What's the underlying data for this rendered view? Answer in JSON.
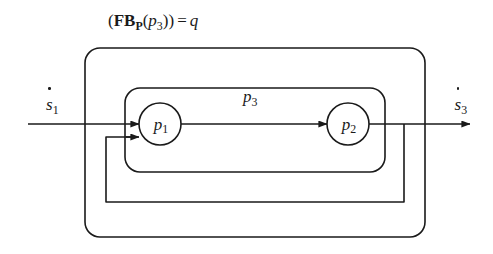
{
  "figure": {
    "title_formula": {
      "open_paren": "(",
      "operator": "FB",
      "operator_subscript": "P",
      "arg_open": "(",
      "argument_base": "p",
      "argument_subscript": "3",
      "arg_close": ")",
      "close_paren": ")",
      "equals": "=",
      "result": "q",
      "plain_text": "(FB_P(p3)) = q"
    },
    "input_signal": {
      "base": "s",
      "subscript": "1",
      "accent": "dot",
      "plain_text": "ṡ1"
    },
    "output_signal": {
      "base": "s",
      "subscript": "3",
      "accent": "dot",
      "plain_text": "ṡ3"
    },
    "inner_block": {
      "base": "p",
      "subscript": "3",
      "plain_text": "p3"
    },
    "nodes": [
      {
        "id": "p1",
        "base": "p",
        "subscript": "1",
        "plain_text": "p1",
        "cx": 160,
        "cy": 124,
        "r": 21
      },
      {
        "id": "p2",
        "base": "p",
        "subscript": "2",
        "plain_text": "p2",
        "cx": 348,
        "cy": 124,
        "r": 21
      }
    ],
    "boxes": [
      {
        "id": "outer-box",
        "x": 85,
        "y": 48,
        "width": 340,
        "height": 189,
        "rx": 15,
        "label": "(FB_P(p3)) = q"
      },
      {
        "id": "inner-box",
        "x": 125,
        "y": 88,
        "width": 260,
        "height": 84,
        "rx": 15,
        "label": "p3"
      },
      {
        "id": "feedback-path",
        "x": 106,
        "y": 137,
        "width": 298,
        "height": 65,
        "rx": 0,
        "label": ""
      }
    ],
    "colors": {
      "stroke": "#1a1a1a",
      "background": "#ffffff",
      "text": "#1a1a1a"
    },
    "stroke_width": 1.6,
    "signal_line_y": 124,
    "input_line_start_x": 28,
    "output_arrow_end_x": 470,
    "feedback_tap_x": 404,
    "feedback_return_x": 106,
    "feedback_entry_y": 137
  }
}
